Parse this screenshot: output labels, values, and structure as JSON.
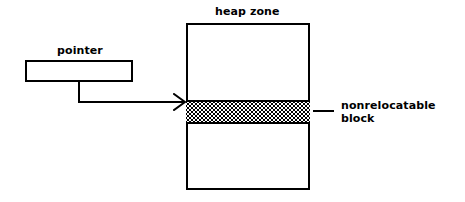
{
  "diagram": {
    "line_color": "#000000",
    "background_color": "#ffffff"
  },
  "heap_zone": {
    "title": "heap zone",
    "block": {
      "label_line_1": "nonrelocatable",
      "label_line_2": "block",
      "fill": "checkered-hatch"
    }
  },
  "pointer": {
    "title": "pointer",
    "value": ""
  },
  "connector": {
    "arrow_head": "arrow-right"
  }
}
